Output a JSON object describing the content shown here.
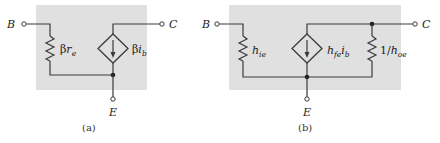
{
  "colors": {
    "panel_fill": "#e0e0e0",
    "wire": "#3a3a3a",
    "background": "#ffffff"
  },
  "panel_a": {
    "caption": "(a)",
    "terminals": {
      "base": "B",
      "collector": "C",
      "emitter": "E"
    },
    "resistor_label": {
      "prefix": "β",
      "var": "r",
      "sub": "e"
    },
    "source_label": {
      "prefix": "β",
      "var": "i",
      "sub": "b"
    }
  },
  "panel_b": {
    "caption": "(b)",
    "terminals": {
      "base": "B",
      "collector": "C",
      "emitter": "E"
    },
    "input_resistor_label": {
      "var": "h",
      "sub": "ie"
    },
    "source_label": {
      "var": "h",
      "sub": "fe",
      "var2": "i",
      "sub2": "b"
    },
    "output_resistor_label": {
      "prefix": "1/",
      "var": "h",
      "sub": "oe"
    }
  },
  "icons": [
    "resistor-icon",
    "dependent-current-source-icon",
    "terminal-icon",
    "junction-dot-icon"
  ]
}
